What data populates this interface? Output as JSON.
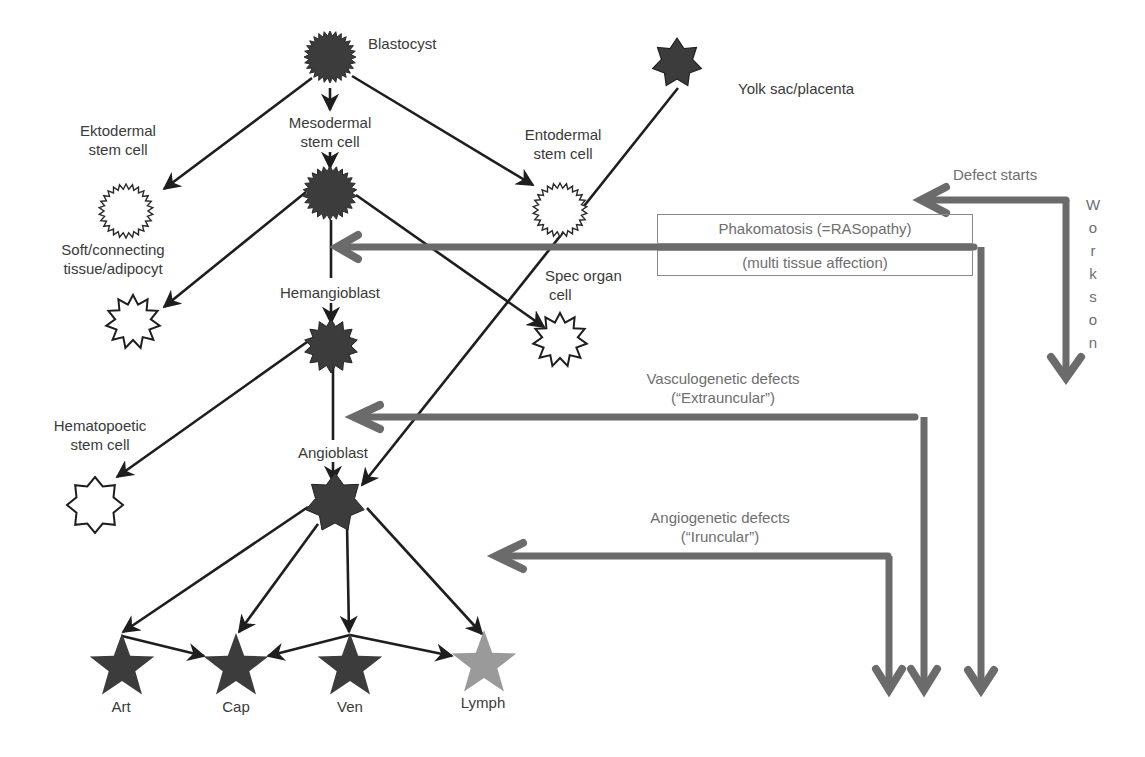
{
  "diagram": {
    "colors": {
      "cell_fill": "#3c3c3c",
      "lymph_fill": "#9a9a9a",
      "line": "#1e1e1e",
      "defect_arrow": "#6b6b6b",
      "text": "#3a3a3a",
      "defect_text": "#6e6e6e"
    },
    "cells": {
      "blastocyst": "Blastocyst",
      "yolk_sac": "Yolk sac/placenta",
      "ektodermal": [
        "Ektodermal",
        "stem cell"
      ],
      "mesodermal": [
        "Mesodermal",
        "stem cell"
      ],
      "entodermal": [
        "Entodermal",
        "stem cell"
      ],
      "soft_tissue": [
        "Soft/connecting",
        "tissue/adipocyt"
      ],
      "hemangioblast": "Hemangioblast",
      "spec_organ": [
        "Spec organ",
        "cell"
      ],
      "hematopoetic": [
        "Hematopoetic",
        "stem cell"
      ],
      "angioblast": "Angioblast",
      "art": "Art",
      "cap": "Cap",
      "ven": "Ven",
      "lymph": "Lymph"
    },
    "defects": {
      "defect_starts": "Defect starts",
      "works_on": [
        "W",
        "o",
        "r",
        "k",
        "s",
        "o",
        "n"
      ],
      "phakomatosis": "Phakomatosis (=RASopathy)",
      "phakomatosis_sub": "(multi tissue affection)",
      "vasculogenetic": "Vasculogenetic defects",
      "vasculogenetic_sub": "(“Extrauncular”)",
      "angiogenetic": "Angiogenetic defects",
      "angiogenetic_sub": "(“Iruncular”)"
    }
  }
}
